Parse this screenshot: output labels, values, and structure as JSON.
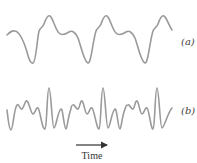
{
  "figure": {
    "panels": [
      {
        "id": "a",
        "label": "(a)",
        "description": "periodic complex waveform with dip, shoulder and peak each cycle",
        "stroke_color": "#9a9a9a"
      },
      {
        "id": "b",
        "label": "(b)",
        "description": "periodic complex waveform with many high-frequency components and tall spike each cycle",
        "stroke_color": "#9a9a9a"
      }
    ],
    "time_axis": {
      "label": "Time",
      "arrow": "right-arrow-icon"
    }
  }
}
